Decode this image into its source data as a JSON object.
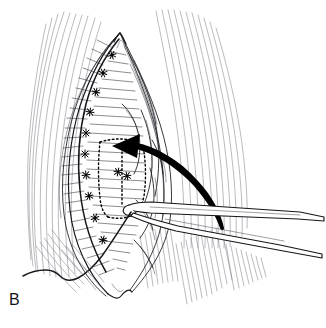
{
  "figure": {
    "domain_kind": "medical-surgical-line-illustration",
    "panel_label": "B",
    "background_color": "#ffffff",
    "ink_color": "#15161a",
    "accent_color": "#000000",
    "width": 326,
    "height": 328
  },
  "elements": {
    "wound_opening_name": "diamond-shaped surgical wound",
    "suture_line_name": "running suture along left wound edge",
    "flap_outline_name": "dotted flap outline",
    "arrow_name": "curved transposition arrow",
    "instrument_name": "surgical forceps",
    "thread_name": "suture thread tail",
    "tissue_name": "striated tissue planes"
  },
  "annotations": {
    "arrow_direction": "right-to-left",
    "arrow_head_x": 113,
    "arrow_head_y": 146,
    "flap_style": "dotted",
    "instrument_entry_edge": "right"
  }
}
